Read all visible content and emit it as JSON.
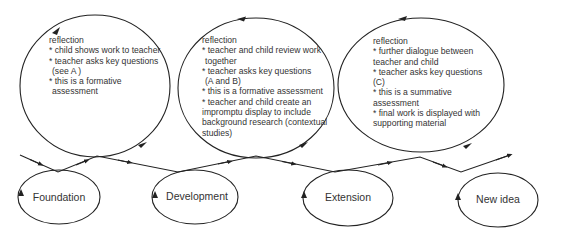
{
  "diagram": {
    "type": "spiral-progression",
    "stages": [
      {
        "label": "Foundation"
      },
      {
        "label": "Development"
      },
      {
        "label": "Extension"
      },
      {
        "label": "New idea"
      }
    ],
    "reflections": [
      {
        "lines": [
          "reflection",
          "* child shows work to teacher",
          "* teacher asks key questions",
          " (see A )",
          "* this is a formative",
          " assessment"
        ]
      },
      {
        "lines": [
          "reflection",
          "* teacher and child review work",
          " together",
          "* teacher asks key questions",
          " (A and B)",
          "* this is a formative assessment",
          "* teacher and child create an",
          "impromptu display to include",
          "background research (contextual",
          "studies)"
        ]
      },
      {
        "lines": [
          "reflection",
          "* further dialogue between",
          "teacher and child",
          "* teacher asks key questions",
          "(C)",
          "* this is a summative",
          "assessment",
          "* final work is displayed with",
          "supporting material"
        ]
      }
    ],
    "colors": {
      "stroke": "#222222",
      "text": "#333333",
      "background": "#ffffff"
    }
  }
}
